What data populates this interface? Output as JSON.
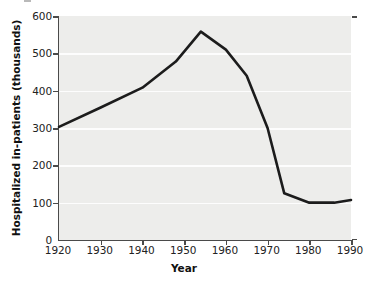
{
  "figure": {
    "background_color": "#ffffff",
    "plot_background_color": "#ededeb",
    "gridline_color": "#fdfdfd",
    "axis_color": "#4a4a4a",
    "line_color": "#1c1c1c"
  },
  "axes": {
    "x_title": "Year",
    "y_title": "Hospitalized in-patients (thousands)",
    "x_ticks": [
      "1920",
      "1930",
      "1940",
      "1950",
      "1960",
      "1970",
      "1980",
      "1990"
    ],
    "y_ticks": [
      "0",
      "100",
      "200",
      "300",
      "400",
      "500",
      "600"
    ]
  },
  "chart_data": {
    "type": "line",
    "title": "",
    "xlabel": "Year",
    "ylabel": "Hospitalized in-patients (thousands)",
    "xlim": [
      1920,
      1990
    ],
    "ylim": [
      0,
      600
    ],
    "xticks": [
      1920,
      1930,
      1940,
      1950,
      1960,
      1970,
      1980,
      1990
    ],
    "yticks": [
      0,
      100,
      200,
      300,
      400,
      500,
      600
    ],
    "grid": "horizontal",
    "legend": "none",
    "series": [
      {
        "name": "Hospitalized in-patients",
        "x": [
          1920,
          1930,
          1940,
          1948,
          1954,
          1960,
          1965,
          1970,
          1974,
          1980,
          1986,
          1990
        ],
        "values": [
          303,
          355,
          408,
          478,
          558,
          510,
          440,
          300,
          125,
          100,
          100,
          107
        ]
      }
    ]
  }
}
